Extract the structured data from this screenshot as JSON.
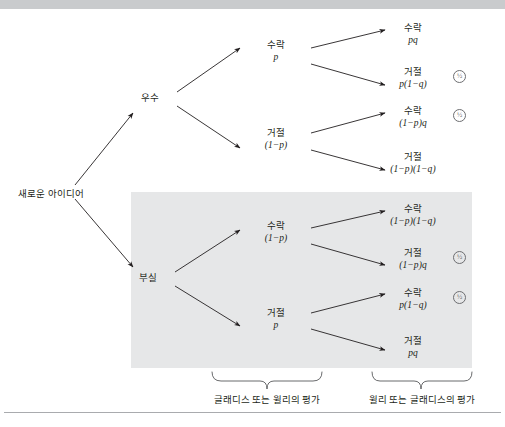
{
  "figure": {
    "root": {
      "label": "새로운 아이디어"
    },
    "level1": [
      {
        "id": "excellent",
        "label": "우수",
        "prob": ""
      },
      {
        "id": "poor",
        "label": "부실",
        "prob": ""
      }
    ],
    "level2": [
      {
        "id": "e-accept",
        "label": "수락",
        "prob": "p"
      },
      {
        "id": "e-reject",
        "label": "거절",
        "prob": "(1−p)"
      },
      {
        "id": "p-accept",
        "label": "수락",
        "prob": "(1−p)"
      },
      {
        "id": "p-reject",
        "label": "거절",
        "prob": "p"
      }
    ],
    "leaves": [
      {
        "id": "leaf-1",
        "label": "수락",
        "prob": "pq",
        "marker": ""
      },
      {
        "id": "leaf-2",
        "label": "거절",
        "prob": "p(1−q)",
        "marker": "½"
      },
      {
        "id": "leaf-3",
        "label": "수락",
        "prob": "(1−p)q",
        "marker": "½"
      },
      {
        "id": "leaf-4",
        "label": "거절",
        "prob": "(1−p)(1−q)",
        "marker": ""
      },
      {
        "id": "leaf-5",
        "label": "수락",
        "prob": "(1−p)(1−q)",
        "marker": ""
      },
      {
        "id": "leaf-6",
        "label": "거절",
        "prob": "(1−p)q",
        "marker": "½"
      },
      {
        "id": "leaf-7",
        "label": "수락",
        "prob": "p(1−q)",
        "marker": "½"
      },
      {
        "id": "leaf-8",
        "label": "거절",
        "prob": "pq",
        "marker": ""
      }
    ],
    "captions": [
      {
        "id": "caption-left",
        "text": "글래디스 또는 윌리의 평가"
      },
      {
        "id": "caption-right",
        "text": "윌리 또는 글래디스의 평가"
      }
    ],
    "colors": {
      "shade": "#e6e7e8",
      "bar": "#c9cbcd",
      "ink": "#231f20",
      "rule": "#a9abae"
    }
  }
}
